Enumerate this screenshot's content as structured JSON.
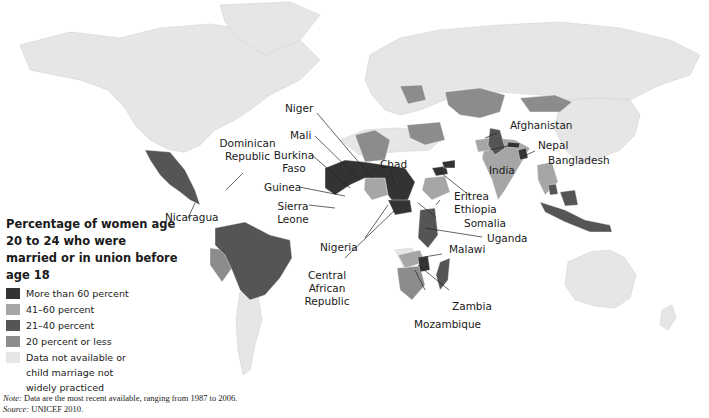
{
  "title": "Percentage of women age 20 to 24 who were married or in union before age 18",
  "legend": {
    "title": "Percentage of women age 20 to 24 who were married or in union before age 18",
    "items": [
      {
        "label": "More than 60 percent",
        "color": "#333333"
      },
      {
        "label": "41–60 percent",
        "color": "#a6a6a6"
      },
      {
        "label": "21–40 percent",
        "color": "#555555"
      },
      {
        "label": "20 percent or less",
        "color": "#8c8c8c"
      },
      {
        "label": "Data not available or child marriage not widely practiced",
        "color": "#e6e6e6"
      }
    ]
  },
  "labels": {
    "niger": "Niger",
    "mali": "Mali",
    "burkina_faso": "Burkina Faso",
    "dominican_republic": "Dominican Republic",
    "guinea": "Guinea",
    "sierra_leone": "Sierra Leone",
    "nicaragua": "Nicaragua",
    "chad": "Chad",
    "afghanistan": "Afghanistan",
    "nepal": "Nepal",
    "bangladesh": "Bangladesh",
    "india": "India",
    "eritrea": "Eritrea",
    "ethiopia": "Ethiopia",
    "somalia": "Somalia",
    "uganda": "Uganda",
    "nigeria": "Nigeria",
    "central_african_republic": "Central African Republic",
    "malawi": "Malawi",
    "zambia": "Zambia",
    "mozambique": "Mozambique"
  },
  "notes": {
    "note_prefix": "Note:",
    "note_text": " Data are the most recent available, ranging from 1987 to 2006.",
    "source_prefix": "Source:",
    "source_text": " UNICEF 2010."
  },
  "colors": {
    "more_than_60": "#333333",
    "41_60": "#a6a6a6",
    "21_40": "#555555",
    "20_or_less": "#8c8c8c",
    "no_data": "#e6e6e6",
    "background": "#ffffff"
  }
}
